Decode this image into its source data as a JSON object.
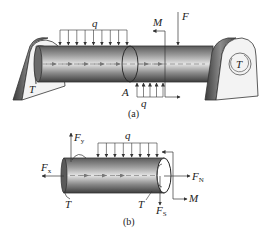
{
  "figure_a": {
    "caption": "(a)",
    "labels": {
      "q_top": "q",
      "q_bottom": "q",
      "M": "M",
      "F": "F",
      "A": "A",
      "T_left": "T",
      "T_right": "T"
    }
  },
  "figure_b": {
    "caption": "(b)",
    "labels": {
      "Fy_main": "F",
      "Fy_sub": "y",
      "Fx_main": "F",
      "Fx_sub": "x",
      "q": "q",
      "FN_main": "F",
      "FN_sub": "N",
      "M": "M",
      "FS_main": "F",
      "FS_sub": "S",
      "T_left": "T",
      "T_right": "T"
    }
  },
  "colors": {
    "line": "#333333",
    "shaft_dark": "#4a4a4a",
    "shaft_light": "#d8d8d8",
    "bracket_face": "#f2f2f2",
    "bracket_edge": "#555555"
  }
}
